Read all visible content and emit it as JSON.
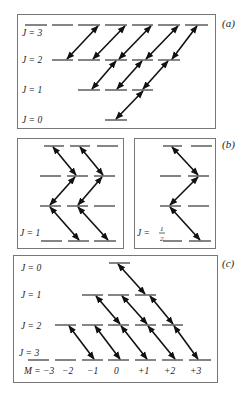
{
  "panels": {
    "a": {
      "label": "(a)",
      "j_labels": [
        "J = 3",
        "J = 2",
        "J = 1",
        "J = 0"
      ]
    },
    "b": {
      "label": "(b)",
      "left_j_label": "J = 1",
      "right_j_label_prefix": "J = ",
      "right_j_num": "1",
      "right_j_den": "2"
    },
    "c": {
      "label": "(c)",
      "j_labels": [
        "J = 0",
        "J = 1",
        "J = 2",
        "J = 3"
      ],
      "m_labels": [
        "M = −3",
        "−2",
        "−1",
        "0",
        "+1",
        "+2",
        "+3"
      ]
    }
  }
}
